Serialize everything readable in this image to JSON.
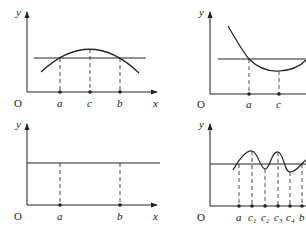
{
  "panels": [
    {
      "id": "top-left",
      "description": "concave-down arc crossing horizontal line at a and b, peak at c",
      "labels": {
        "y_axis": "y",
        "x_axis": "x",
        "origin": "O"
      },
      "points": [
        {
          "label": "a"
        },
        {
          "label": "c"
        },
        {
          "label": "b"
        }
      ]
    },
    {
      "id": "top-right",
      "description": "convex curve crossing horizontal line at a, minimum at c",
      "labels": {
        "y_axis": "y",
        "origin": "O"
      },
      "points": [
        {
          "label": "a"
        },
        {
          "label": "c"
        }
      ]
    },
    {
      "id": "bottom-left",
      "description": "constant horizontal line over [a, b]",
      "labels": {
        "y_axis": "y",
        "x_axis": "x",
        "origin": "O"
      },
      "points": [
        {
          "label": "a"
        },
        {
          "label": "b"
        }
      ]
    },
    {
      "id": "bottom-right",
      "description": "oscillating curve with extrema c1..c4 between a and b",
      "labels": {
        "y_axis": "y",
        "origin": "O"
      },
      "points": [
        {
          "label": "a"
        },
        {
          "label": "c",
          "sub": "1"
        },
        {
          "label": "c",
          "sub": "2"
        },
        {
          "label": "c",
          "sub": "3"
        },
        {
          "label": "c",
          "sub": "4"
        },
        {
          "label": "b"
        }
      ]
    }
  ],
  "colors": {
    "stroke": "#222222",
    "background": "#ffffff"
  }
}
